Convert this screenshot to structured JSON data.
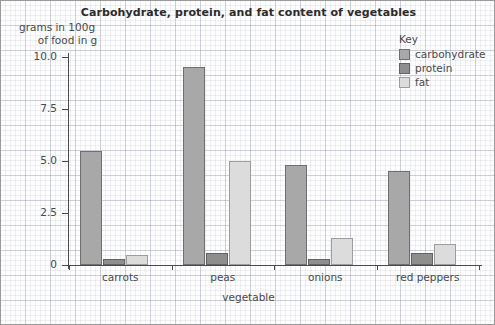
{
  "chart_data": {
    "type": "bar",
    "title": "Carbohydrate, protein, and fat content of vegetables",
    "xlabel": "vegetable",
    "ylabel_line1": "grams in 100g",
    "ylabel_line2": "of food in g",
    "categories": [
      "carrots",
      "peas",
      "onions",
      "red peppers"
    ],
    "series": [
      {
        "name": "carbohydrate",
        "color": "#a8a8a8",
        "values": [
          5.5,
          9.5,
          4.8,
          4.5
        ]
      },
      {
        "name": "protein",
        "color": "#8e8e8e",
        "values": [
          0.3,
          0.6,
          0.3,
          0.6
        ]
      },
      {
        "name": "fat",
        "color": "#dcdcdc",
        "values": [
          0.5,
          5.0,
          1.3,
          1.0
        ]
      }
    ],
    "ylim": [
      0,
      10
    ],
    "yticks": [
      0,
      2.5,
      5.0,
      7.5,
      10.0
    ],
    "ytick_labels": [
      "0",
      "2.5",
      "5.0",
      "7.5",
      "10.0"
    ],
    "grid": true,
    "grid_style": "graph-paper",
    "legend_title": "Key",
    "legend_position": "top-right"
  }
}
